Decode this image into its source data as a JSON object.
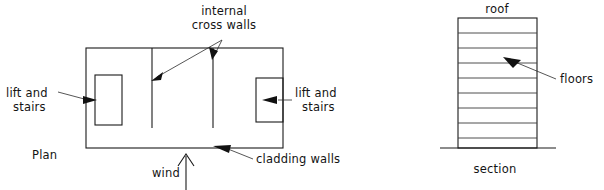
{
  "figure": {
    "title": "",
    "background_color": "#ffffff",
    "line_color": "#1a1a1a",
    "text_color": "#141414"
  },
  "plan": {
    "caption": "Plan",
    "labels": {
      "internal_cross_walls_line1": "internal",
      "internal_cross_walls_line2": "cross walls",
      "lift_and_stairs_left_line1": "lift and",
      "lift_and_stairs_left_line2": "stairs",
      "lift_and_stairs_right_line1": "lift and",
      "lift_and_stairs_right_line2": "stairs",
      "cladding_walls": "cladding walls",
      "wind": "wind"
    },
    "geometry": {
      "outline": {
        "x": 86,
        "y": 48,
        "width": 197,
        "height": 100
      },
      "cross_walls_x": [
        152,
        213
      ],
      "cross_wall_top_y": 48,
      "cross_wall_bottom_y": 128,
      "lift_box_left": {
        "x": 95,
        "y": 75,
        "width": 27,
        "height": 50
      },
      "lift_box_right": {
        "x": 256,
        "y": 78,
        "width": 27,
        "height": 44
      }
    }
  },
  "section": {
    "caption": "section",
    "labels": {
      "roof": "roof",
      "floors": "floors"
    },
    "geometry": {
      "outline": {
        "x": 458,
        "y": 18,
        "width": 79,
        "height": 130
      },
      "floor_lines_y": [
        33,
        48,
        63,
        78,
        93,
        108,
        123,
        138
      ],
      "ground_line": {
        "x1": 440,
        "x2": 556,
        "y": 148
      },
      "floor_count": 8
    }
  },
  "annotations": {
    "cross_wall_apex": {
      "x": 222,
      "y": 40
    },
    "cross_wall_arrow_left_target": {
      "x": 154,
      "y": 80
    },
    "cross_wall_arrow_right_target": {
      "x": 213,
      "y": 57
    },
    "lift_left_arrow_target": {
      "x": 95,
      "y": 100
    },
    "lift_right_arrow_target": {
      "x": 271,
      "y": 100
    },
    "cladding_arrow_target": {
      "x": 222,
      "y": 148
    },
    "floors_arrow_target": {
      "x": 518,
      "y": 63
    },
    "wind_arrow_tip": {
      "x": 186,
      "y": 154
    },
    "wind_arrow_tail": {
      "x": 186,
      "y": 190
    }
  }
}
